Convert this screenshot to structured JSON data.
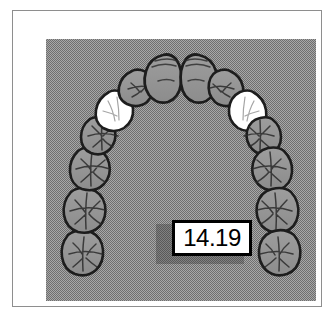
{
  "figure": {
    "kind": "dental-arch-occlusal-illustration",
    "title": "Maxillary arch occlusal view with intercanine measurement",
    "frame_border_color": "#8e8e8e",
    "plate_background_color": "#a8a8a8",
    "plate_dither": "checkerboard"
  },
  "measurement": {
    "value": "14.19",
    "box_fill": "#ffffff",
    "box_border": "#000000",
    "shadow_color": "#5a5a5a"
  },
  "legend": {
    "highlight_fill": "#ffffff",
    "normal_fill": "#9a9a9a",
    "outline": "#1a1a1a"
  },
  "arch": {
    "description": "Fourteen teeth arranged in a U-shaped dental arch; the two canines are highlighted white.",
    "teeth": [
      {
        "id": "tooth-L7",
        "label": "left second molar",
        "side": "left",
        "type": "molar",
        "highlighted": false
      },
      {
        "id": "tooth-L6",
        "label": "left first molar",
        "side": "left",
        "type": "molar",
        "highlighted": false
      },
      {
        "id": "tooth-L5",
        "label": "left second premolar",
        "side": "left",
        "type": "premolar",
        "highlighted": false
      },
      {
        "id": "tooth-L4",
        "label": "left first premolar",
        "side": "left",
        "type": "premolar",
        "highlighted": false
      },
      {
        "id": "tooth-L3",
        "label": "left canine",
        "side": "left",
        "type": "canine",
        "highlighted": true
      },
      {
        "id": "tooth-L2",
        "label": "left lateral incisor",
        "side": "left",
        "type": "incisor",
        "highlighted": false
      },
      {
        "id": "tooth-L1",
        "label": "left central incisor",
        "side": "left",
        "type": "incisor",
        "highlighted": false
      },
      {
        "id": "tooth-R1",
        "label": "right central incisor",
        "side": "right",
        "type": "incisor",
        "highlighted": false
      },
      {
        "id": "tooth-R2",
        "label": "right lateral incisor",
        "side": "right",
        "type": "incisor",
        "highlighted": false
      },
      {
        "id": "tooth-R3",
        "label": "right canine",
        "side": "right",
        "type": "canine",
        "highlighted": true
      },
      {
        "id": "tooth-R4",
        "label": "right first premolar",
        "side": "right",
        "type": "premolar",
        "highlighted": false
      },
      {
        "id": "tooth-R5",
        "label": "right second premolar",
        "side": "right",
        "type": "premolar",
        "highlighted": false
      },
      {
        "id": "tooth-R6",
        "label": "right first molar",
        "side": "right",
        "type": "molar",
        "highlighted": false
      },
      {
        "id": "tooth-R7",
        "label": "right second molar",
        "side": "right",
        "type": "molar",
        "highlighted": false
      }
    ]
  }
}
